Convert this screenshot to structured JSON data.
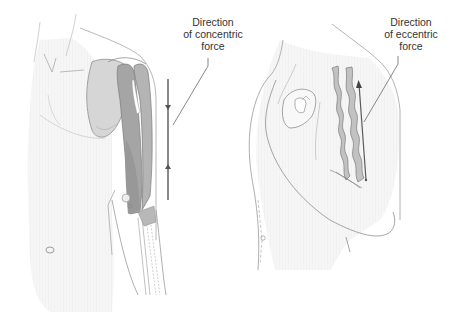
{
  "figure": {
    "panels": [
      {
        "id": "concentric",
        "description": "Front view of torso with arm extended downward; biceps/triceps muscles shown shortening",
        "label_lines": [
          "Direction",
          "of concentric",
          "force"
        ],
        "arrow": {
          "direction": "bidirectional-inward",
          "color": "#6b6b6b"
        }
      },
      {
        "id": "eccentric",
        "description": "Side view of torso with arm flexed, fist raised; muscle shown as wavy bands lengthening",
        "label_lines": [
          "Direction",
          "of eccentric",
          "force"
        ],
        "arrow": {
          "direction": "up",
          "color": "#5a5a5a"
        }
      }
    ],
    "colors": {
      "skin_shade": "#f3f3f3",
      "outline": "#9a9a9a",
      "muscle_dark": "#9c9c9c",
      "muscle_mid": "#b9b9b9",
      "muscle_light": "#d0d0d0",
      "scapula": "#d6d6d6",
      "text": "#333333"
    }
  }
}
